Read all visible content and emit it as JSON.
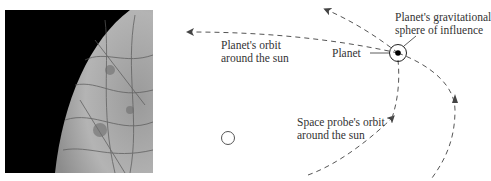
{
  "photo": {
    "description": "Moon surface photograph (Europa-like, cracked icy surface against black space)"
  },
  "labels": {
    "planet_orbit": [
      "Planet's orbit",
      "around the sun"
    ],
    "planet": "Planet",
    "sphere": [
      "Planet's gravitational",
      "sphere of influence"
    ],
    "probe_orbit": [
      "Space probe's orbit",
      "around the sun"
    ]
  },
  "colors": {
    "line": "#555555",
    "text": "#333333",
    "background": "#ffffff"
  }
}
